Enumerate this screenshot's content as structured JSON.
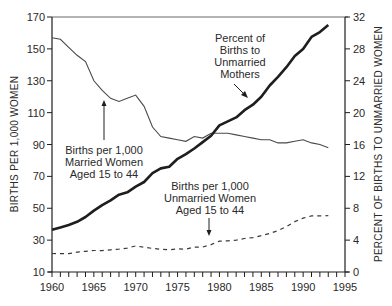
{
  "chart_data": {
    "type": "line",
    "title": "",
    "xlabel": "",
    "ylabel": "BIRTHS PER 1,000 WOMEN",
    "ylabel_right": "PERCENT OF BIRTHS TO UNMARRIED WOMEN",
    "xlim": [
      1960,
      1995
    ],
    "ylim": [
      10,
      170
    ],
    "ylim_right": [
      0,
      32
    ],
    "x_ticks": [
      1960,
      1965,
      1970,
      1975,
      1980,
      1985,
      1990,
      1995
    ],
    "y_ticks": [
      10,
      30,
      50,
      70,
      90,
      110,
      130,
      150,
      170
    ],
    "y_ticks_right": [
      0,
      4,
      8,
      12,
      16,
      20,
      24,
      28,
      32
    ],
    "grid": false,
    "legend": "none (inline annotations)",
    "x": [
      1960,
      1961,
      1962,
      1963,
      1964,
      1965,
      1966,
      1967,
      1968,
      1969,
      1970,
      1971,
      1972,
      1973,
      1974,
      1975,
      1976,
      1977,
      1978,
      1979,
      1980,
      1981,
      1982,
      1983,
      1984,
      1985,
      1986,
      1987,
      1988,
      1989,
      1990,
      1991,
      1992,
      1993
    ],
    "series": [
      {
        "name": "Births per 1,000 Married Women Aged 15 to 44",
        "axis": "left",
        "style": "thin-solid",
        "values": [
          157,
          156,
          151,
          146,
          142,
          130,
          124,
          119,
          117,
          119,
          121,
          114,
          101,
          95,
          94,
          93,
          92,
          95,
          94,
          97,
          97,
          97,
          96,
          95,
          94,
          93,
          93,
          91,
          91,
          92,
          93,
          91,
          90,
          88
        ]
      },
      {
        "name": "Percent of Births to Unmarried Mothers",
        "axis": "right",
        "style": "thick-solid",
        "values": [
          5.3,
          5.6,
          5.9,
          6.3,
          6.9,
          7.7,
          8.4,
          9.0,
          9.7,
          10.0,
          10.7,
          11.3,
          12.4,
          13.0,
          13.2,
          14.2,
          14.8,
          15.5,
          16.3,
          17.1,
          18.4,
          18.9,
          19.4,
          20.3,
          21.0,
          22.0,
          23.4,
          24.5,
          25.7,
          27.1,
          28.0,
          29.5,
          30.1,
          31.0
        ]
      },
      {
        "name": "Births per 1,000 Unmarried Women Aged 15 to 44",
        "axis": "left",
        "style": "dashed",
        "values": [
          21.6,
          21.5,
          21.5,
          22.5,
          23.0,
          23.5,
          23.4,
          23.9,
          24.4,
          25.0,
          26.4,
          25.5,
          24.8,
          24.3,
          23.9,
          24.5,
          24.3,
          25.6,
          25.7,
          27.2,
          29.4,
          29.5,
          30.0,
          31.0,
          31.6,
          32.8,
          34.2,
          36.0,
          38.5,
          41.6,
          43.8,
          45.2,
          45.2,
          45.3
        ]
      }
    ],
    "annotations": [
      {
        "lines": [
          "Percent of",
          "Births to",
          "Unmarried",
          "Mothers"
        ],
        "arrow": "diagonal down-right to thick line"
      },
      {
        "lines": [
          "Births per 1,000",
          "Married Women",
          "Aged 15 to 44"
        ],
        "arrow": "up to thin line"
      },
      {
        "lines": [
          "Births per 1,000",
          "Unmarried Women",
          "Aged 15 to 44"
        ],
        "arrow": "down to dashed line"
      }
    ]
  },
  "colors": {
    "ink": "#1e1e1e",
    "thin_line": "#4a4a4a",
    "text": "#2a2a2a",
    "background": "#ffffff"
  }
}
